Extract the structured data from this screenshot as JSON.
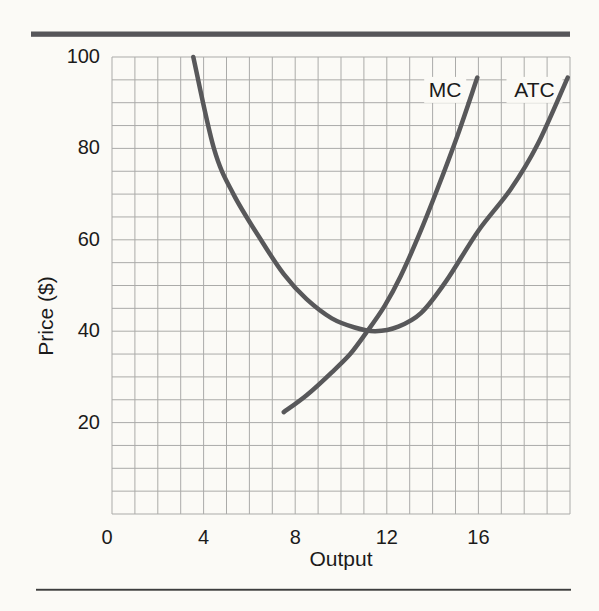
{
  "figure": {
    "background": "#fbfaf6",
    "top_rule_color": "#565659",
    "bottom_rule_color": "#3d3d3d",
    "text_color": "#1b1b1b"
  },
  "chart_data": {
    "type": "line",
    "title": "",
    "xlabel": "Output",
    "ylabel": "Price ($)",
    "xlim": [
      0,
      20
    ],
    "ylim": [
      0,
      100
    ],
    "x_tick_values": [
      0,
      4,
      8,
      12,
      16
    ],
    "x_tick_labels": [
      "0",
      "4",
      "8",
      "12",
      "16"
    ],
    "y_tick_values": [
      20,
      40,
      60,
      80,
      100
    ],
    "y_tick_labels": [
      "20",
      "40",
      "60",
      "80",
      "100"
    ],
    "grid": {
      "on": true,
      "x_step": 1,
      "y_step": 5,
      "color": "#ababa9"
    },
    "legend_position": "inline-labels",
    "curve_color": "#58585a",
    "curve_width": 4.5,
    "series": [
      {
        "name": "MC",
        "label_anchor": [
          14.55,
          92.8
        ],
        "points": [
          [
            7.5,
            22.3
          ],
          [
            8.5,
            26
          ],
          [
            9.6,
            31
          ],
          [
            10.4,
            35
          ],
          [
            11.15,
            40
          ],
          [
            11.9,
            45.5
          ],
          [
            12.6,
            52
          ],
          [
            13.4,
            61
          ],
          [
            14.2,
            71
          ],
          [
            15.1,
            83
          ],
          [
            15.95,
            95.5
          ]
        ]
      },
      {
        "name": "ATC",
        "label_anchor": [
          18.45,
          92.8
        ],
        "points": [
          [
            3.55,
            100
          ],
          [
            4.45,
            80
          ],
          [
            5.3,
            70
          ],
          [
            6.5,
            60
          ],
          [
            7.5,
            52.5
          ],
          [
            8.5,
            47
          ],
          [
            9.6,
            42.8
          ],
          [
            10.6,
            40.8
          ],
          [
            11.5,
            40
          ],
          [
            12.5,
            41
          ],
          [
            13.5,
            44
          ],
          [
            14.6,
            51
          ],
          [
            16,
            62
          ],
          [
            17.4,
            71
          ],
          [
            18.6,
            81
          ],
          [
            19.9,
            95.5
          ]
        ]
      }
    ],
    "annotations": {
      "mc_crosses_atc_at_min": {
        "output": 11.2,
        "price": 40
      }
    }
  }
}
